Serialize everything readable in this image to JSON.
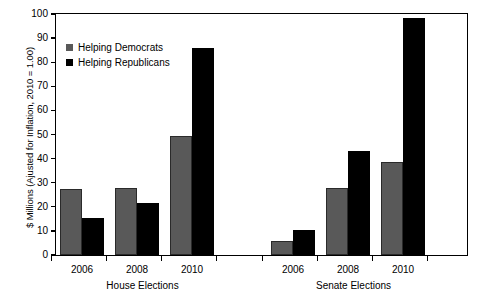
{
  "chart_data": {
    "type": "bar",
    "title": "",
    "xlabel": "",
    "ylabel": "$ Millions (Ajusted for Inflation, 2010 = 1.00)",
    "ylim": [
      0,
      100
    ],
    "ytick_values": [
      0,
      10,
      20,
      30,
      40,
      50,
      60,
      70,
      80,
      90,
      100
    ],
    "ytick_labels": [
      "0",
      "10",
      "20",
      "30",
      "40",
      "50",
      "60",
      "70",
      "80",
      "90",
      "100"
    ],
    "grid": false,
    "legend_position": "upper left",
    "groups": [
      {
        "name": "House Elections",
        "categories": [
          "2006",
          "2008",
          "2010"
        ]
      },
      {
        "name": "Senate Elections",
        "categories": [
          "2006",
          "2008",
          "2010"
        ]
      }
    ],
    "categories": [
      "2006",
      "2008",
      "2010",
      "2006",
      "2008",
      "2010"
    ],
    "series": [
      {
        "name": "Helping Democrats",
        "color": "#595959",
        "values": [
          27.5,
          27.8,
          49.2,
          5.8,
          27.8,
          38.5
        ]
      },
      {
        "name": "Helping Republicans",
        "color": "#000000",
        "values": [
          15.5,
          21.5,
          85.8,
          10.5,
          43.3,
          98.3
        ]
      }
    ]
  },
  "legend": {
    "entries": [
      {
        "label": "Helping Democrats",
        "swatch": "dem"
      },
      {
        "label": "Helping Republicans",
        "swatch": "rep"
      }
    ]
  }
}
